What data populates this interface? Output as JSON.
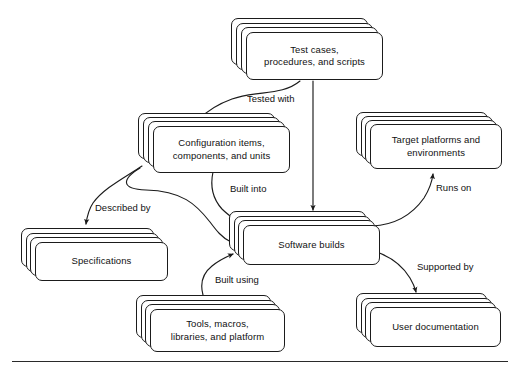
{
  "diagram": {
    "style": {
      "line_color": "#1b1b1b",
      "fill_color": "#ffffff",
      "text_color": "#111111",
      "stack_layers": 4
    },
    "nodes": [
      {
        "id": "test-cases",
        "label": "Test cases,\nprocedures, and scripts",
        "x": 231,
        "y": 18,
        "w": 152,
        "h": 62,
        "layers": 4
      },
      {
        "id": "configuration-items",
        "label": "Configuration items,\ncomponents, and units",
        "x": 138,
        "y": 113,
        "w": 152,
        "h": 60,
        "layers": 4
      },
      {
        "id": "target-platforms",
        "label": "Target platforms and\nenvironments",
        "x": 356,
        "y": 112,
        "w": 146,
        "h": 57,
        "layers": 4
      },
      {
        "id": "specifications",
        "label": "Specifications",
        "x": 21,
        "y": 228,
        "w": 147,
        "h": 53,
        "layers": 4
      },
      {
        "id": "software-builds",
        "label": "Software builds",
        "x": 229,
        "y": 211,
        "w": 151,
        "h": 54,
        "layers": 4
      },
      {
        "id": "tools-macros",
        "label": "Tools, macros,\nlibraries, and platform",
        "x": 136,
        "y": 295,
        "w": 149,
        "h": 57,
        "layers": 4
      },
      {
        "id": "user-documentation",
        "label": "User documentation",
        "x": 356,
        "y": 293,
        "w": 145,
        "h": 54,
        "layers": 4
      }
    ],
    "edges": [
      {
        "id": "tested-with",
        "label": "Tested with",
        "from": "test-cases",
        "to": "configuration-items",
        "label_x": 247,
        "label_y": 93
      },
      {
        "id": "test-cases-to-builds",
        "label": "",
        "from": "test-cases",
        "to": "software-builds",
        "label_x": 0,
        "label_y": 0
      },
      {
        "id": "described-by",
        "label": "Described by",
        "from": "configuration-items",
        "to": "specifications",
        "label_x": 95,
        "label_y": 202
      },
      {
        "id": "built-into",
        "label": "Built into",
        "from": "configuration-items",
        "to": "software-builds",
        "label_x": 230,
        "label_y": 183
      },
      {
        "id": "configuration-to-builds-curve",
        "label": "",
        "from": "configuration-items",
        "to": "software-builds",
        "label_x": 0,
        "label_y": 0
      },
      {
        "id": "runs-on",
        "label": "Runs on",
        "from": "software-builds",
        "to": "target-platforms",
        "label_x": 436,
        "label_y": 182
      },
      {
        "id": "supported-by",
        "label": "Supported by",
        "from": "software-builds",
        "to": "user-documentation",
        "label_x": 417,
        "label_y": 261
      },
      {
        "id": "built-using",
        "label": "Built using",
        "from": "tools-macros",
        "to": "software-builds",
        "label_x": 215,
        "label_y": 274
      }
    ],
    "footer_rule": {
      "x": 12,
      "y": 361,
      "w": 496,
      "h": 1.4
    }
  }
}
